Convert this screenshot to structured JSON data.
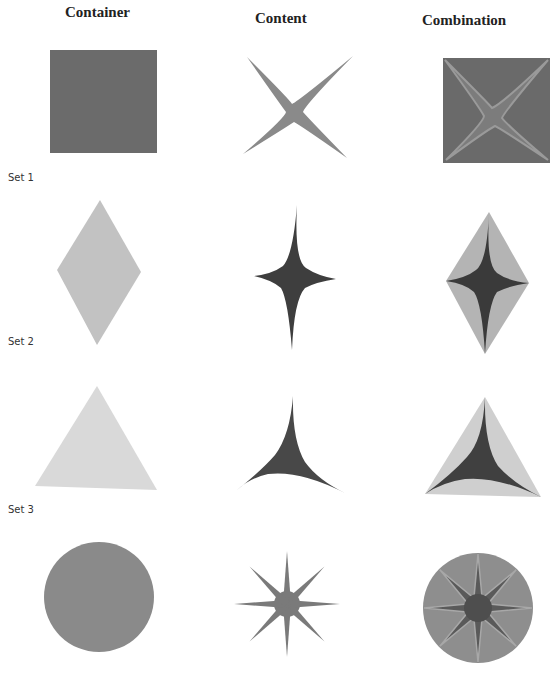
{
  "columns": [
    {
      "label": "Container",
      "x": 65
    },
    {
      "label": "Content",
      "x": 255
    },
    {
      "label": "Combination",
      "x": 422
    }
  ],
  "sets": [
    {
      "label": "Set 1",
      "y": 172
    },
    {
      "label": "Set 2",
      "y": 336
    },
    {
      "label": "Set 3",
      "y": 504
    }
  ],
  "rows": [
    {
      "container": "square",
      "content": "four-point-x-star",
      "combination": "square-with-x-star"
    },
    {
      "container": "diamond",
      "content": "four-point-vertical-star",
      "combination": "diamond-with-star"
    },
    {
      "container": "triangle",
      "content": "three-point-star",
      "combination": "triangle-with-star"
    },
    {
      "container": "circle",
      "content": "eight-point-star",
      "combination": "circle-with-star"
    }
  ],
  "colors": {
    "square": "#6b6b6b",
    "xstar": "#8a8a8a",
    "diamond": "#c2c2c2",
    "vstar": "#3e3e3e",
    "triangle": "#d9d9d9",
    "tristar": "#484848",
    "circle": "#8a8a8a",
    "star8": "#7a7a7a",
    "combo_circle": "#8e8e8e",
    "combo_star8": "#5a5a5a"
  }
}
